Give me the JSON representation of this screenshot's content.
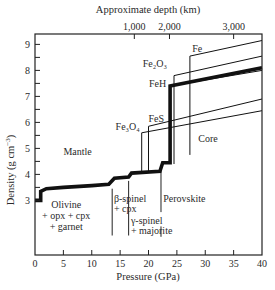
{
  "chart_data": {
    "type": "line",
    "title": "",
    "xlabel": "Pressure (GPa)",
    "ylabel": "Density (g cm^-3)",
    "top_axis_label": "Approximate depth (km)",
    "xlim": [
      0,
      40
    ],
    "ylim": [
      0.9,
      9.4
    ],
    "grid": false,
    "x_ticks": [
      0,
      5,
      10,
      15,
      20,
      25,
      30,
      35,
      40
    ],
    "x_tick_labels": [
      "0",
      "5",
      "10",
      "15",
      "20",
      "25",
      "30",
      "35",
      "40"
    ],
    "y_ticks": [
      3,
      3.5,
      4,
      4.5,
      5,
      5.5,
      6,
      6.5,
      7,
      7.5,
      8,
      8.5,
      9
    ],
    "y_tick_labels": {
      "3": "3",
      "4": "4",
      "5": "5",
      "6": "6",
      "7": "7",
      "8": "8",
      "9": "9"
    },
    "top_ticks": [
      {
        "pressure": 17.5,
        "label": "1,000"
      },
      {
        "pressure": 23.7,
        "label": "2,000"
      },
      {
        "pressure": 35.0,
        "label": "3,000"
      }
    ],
    "series": [
      {
        "name": "Mantle / Earth (PREM)",
        "style": "thick",
        "points": [
          [
            0,
            3.0
          ],
          [
            1,
            3.0
          ],
          [
            1,
            3.35
          ],
          [
            2,
            3.45
          ],
          [
            5,
            3.5
          ],
          [
            10,
            3.57
          ],
          [
            13,
            3.62
          ],
          [
            14,
            3.85
          ],
          [
            16.5,
            3.9
          ],
          [
            17,
            4.05
          ],
          [
            22,
            4.12
          ],
          [
            22.5,
            4.45
          ],
          [
            23.8,
            4.45
          ],
          [
            23.8,
            7.4
          ],
          [
            40,
            8.1
          ]
        ]
      },
      {
        "name": "FeH",
        "style": "thin",
        "points": [
          [
            23.7,
            4.4
          ],
          [
            23.7,
            7.4
          ],
          [
            40,
            8.0
          ]
        ]
      },
      {
        "name": "Fe2O3",
        "style": "thin",
        "points": [
          [
            24.5,
            4.4
          ],
          [
            24.5,
            7.8
          ],
          [
            40,
            8.55
          ]
        ]
      },
      {
        "name": "Fe",
        "style": "thin",
        "points": [
          [
            27.3,
            4.75
          ],
          [
            27.3,
            8.55
          ],
          [
            40,
            9.15
          ]
        ]
      },
      {
        "name": "FeS",
        "style": "thin",
        "points": [
          [
            20.0,
            4.1
          ],
          [
            20.0,
            5.85
          ],
          [
            40,
            6.9
          ]
        ]
      },
      {
        "name": "Fe3O4",
        "style": "thin",
        "points": [
          [
            18.8,
            4.1
          ],
          [
            18.8,
            5.6
          ],
          [
            40,
            6.45
          ]
        ]
      }
    ],
    "phase_boundaries": [
      {
        "pressure": 13.6,
        "y_bottom": 1.65,
        "y_top": 3.45
      },
      {
        "pressure": 16.5,
        "y_bottom": 1.65,
        "y_top": 3.75
      },
      {
        "pressure": 22.2,
        "y_bottom": 2.55,
        "y_top": 4.25
      },
      {
        "pressure": 22.2,
        "y_bottom": 1.6,
        "y_top": 2.0
      }
    ],
    "annotations": [
      {
        "text": "Fe",
        "x": 27.7,
        "y": 8.7
      },
      {
        "text": "Fe₂O₃",
        "x": 19.0,
        "y": 8.15
      },
      {
        "text": "FeH",
        "x": 20.1,
        "y": 7.35
      },
      {
        "text": "FeS",
        "x": 20.0,
        "y": 6.0
      },
      {
        "text": "Fe₃O₄",
        "x": 14.2,
        "y": 5.7
      },
      {
        "text": "Mantle",
        "x": 7.5,
        "y": 4.75
      },
      {
        "text": "Core",
        "x": 30.5,
        "y": 5.25
      },
      {
        "text": "Olivine",
        "x": 5.5,
        "y": 2.7
      },
      {
        "text": "+ opx + cpx",
        "x": 5.5,
        "y": 2.28
      },
      {
        "text": "+ garnet",
        "x": 5.5,
        "y": 1.88
      },
      {
        "text": "β-spinel",
        "x": 13.9,
        "y": 2.95
      },
      {
        "text": "+ cpx",
        "x": 13.9,
        "y": 2.55
      },
      {
        "text": "γ-spinel",
        "x": 16.9,
        "y": 2.1
      },
      {
        "text": "+ majorite",
        "x": 16.9,
        "y": 1.7
      },
      {
        "text": "Perovskite",
        "x": 22.6,
        "y": 2.95
      }
    ]
  }
}
